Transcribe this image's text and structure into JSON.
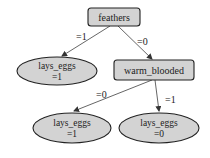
{
  "diagram": {
    "type": "decision-tree",
    "colors": {
      "node_fill": "#d3d3d3",
      "node_stroke": "#222222",
      "edge": "#444444",
      "background": "#ffffff"
    },
    "nodes": {
      "root": {
        "label": "feathers",
        "shape": "rounded-rect"
      },
      "leaf_left": {
        "label": "lays_eggs",
        "value": "=1",
        "shape": "ellipse"
      },
      "warm": {
        "label": "warm_blooded",
        "shape": "rounded-rect"
      },
      "leaf_bl": {
        "label": "lays_eggs",
        "value": "=1",
        "shape": "ellipse"
      },
      "leaf_br": {
        "label": "lays_eggs",
        "value": "=0",
        "shape": "ellipse"
      }
    },
    "edges": {
      "root_to_left": {
        "label": "=1"
      },
      "root_to_warm": {
        "label": "=0"
      },
      "warm_to_bl": {
        "label": "=0"
      },
      "warm_to_br": {
        "label": "=1"
      }
    }
  }
}
